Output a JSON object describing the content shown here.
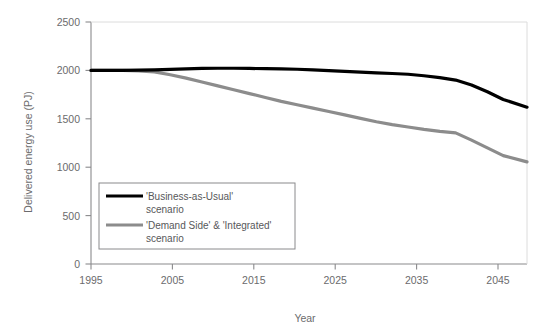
{
  "chart_data": {
    "type": "line",
    "title": "",
    "xlabel": "Year",
    "ylabel": "Delivered energy use (PJ)",
    "xlim": [
      1995,
      2050
    ],
    "ylim": [
      0,
      2500
    ],
    "ytick_values": [
      0,
      500,
      1000,
      1500,
      2000,
      2500
    ],
    "ytick_labels": [
      "0",
      "500",
      "1000",
      "1500",
      "2000",
      "2500"
    ],
    "xtick_values": [
      1995,
      2005,
      2015,
      2025,
      2035,
      2045
    ],
    "xtick_labels": [
      "1995",
      "2005",
      "2015",
      "2025",
      "2035",
      "2045"
    ],
    "grid": false,
    "legend_position": "lower-left-inside",
    "x": [
      1995,
      1997,
      1999,
      2001,
      2003,
      2005,
      2007,
      2009,
      2011,
      2013,
      2015,
      2017,
      2019,
      2021,
      2023,
      2025,
      2027,
      2029,
      2031,
      2033,
      2035,
      2037,
      2039,
      2041,
      2043,
      2045,
      2047,
      2050
    ],
    "series": [
      {
        "name": "'Business-as-Usual' scenario",
        "color": "#000000",
        "width": 3.2,
        "values": [
          2000,
          2000,
          2000,
          2002,
          2005,
          2010,
          2015,
          2020,
          2022,
          2022,
          2020,
          2018,
          2015,
          2012,
          2005,
          1998,
          1990,
          1982,
          1975,
          1968,
          1960,
          1945,
          1925,
          1900,
          1850,
          1780,
          1700,
          1620
        ]
      },
      {
        "name": "'Demand Side' & 'Integrated' scenario",
        "color": "#8c8c8c",
        "width": 3.2,
        "values": [
          2000,
          2000,
          2000,
          1995,
          1985,
          1955,
          1920,
          1880,
          1840,
          1800,
          1760,
          1720,
          1680,
          1645,
          1610,
          1575,
          1540,
          1505,
          1470,
          1440,
          1415,
          1390,
          1370,
          1355,
          1280,
          1200,
          1120,
          1055
        ]
      }
    ],
    "annotations": []
  },
  "legend": {
    "entries": [
      {
        "line1": "'Business-as-Usual'",
        "line2": "scenario",
        "swatch_color": "#000000"
      },
      {
        "line1": "'Demand Side' & 'Integrated'",
        "line2": "scenario",
        "swatch_color": "#8c8c8c"
      }
    ]
  },
  "axes": {
    "y_title": "Delivered energy use (PJ)",
    "x_title": "Year",
    "y_ticks": [
      "2500",
      "2000",
      "1500",
      "1000",
      "500",
      "0"
    ],
    "x_ticks": [
      "1995",
      "2005",
      "2015",
      "2025",
      "2035",
      "2045"
    ]
  },
  "colors": {
    "background": "#ffffff",
    "axis": "#8a8a8c",
    "text": "#6b6b6d",
    "series_bau": "#000000",
    "series_dsi": "#8c8c8c",
    "legend_border": "#8a8a8c"
  }
}
